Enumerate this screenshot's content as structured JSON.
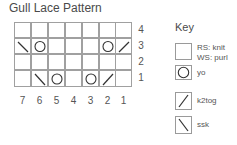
{
  "title": "Gull Lace Pattern",
  "chart": {
    "columns": 7,
    "rows": 4,
    "row_labels": [
      "4",
      "3",
      "2",
      "1"
    ],
    "column_labels": [
      "7",
      "6",
      "5",
      "4",
      "3",
      "2",
      "1"
    ],
    "cells": [
      [
        "",
        "",
        "",
        "",
        "",
        "",
        ""
      ],
      [
        "ssk",
        "yo",
        "",
        "",
        "",
        "yo",
        "k2tog"
      ],
      [
        "",
        "",
        "",
        "",
        "",
        "",
        ""
      ],
      [
        "",
        "ssk",
        "yo",
        "",
        "yo",
        "k2tog",
        ""
      ]
    ]
  },
  "key": {
    "title": "Key",
    "items": [
      {
        "symbol": "blank",
        "label_line1": "RS: knit",
        "label_line2": "WS: purl"
      },
      {
        "symbol": "yo",
        "label_line1": "yo",
        "label_line2": ""
      },
      {
        "symbol": "k2tog",
        "label_line1": "k2tog",
        "label_line2": ""
      },
      {
        "symbol": "ssk",
        "label_line1": "ssk",
        "label_line2": ""
      }
    ]
  },
  "colors": {
    "grid_line": "#a0a0a0",
    "symbol": "#333333",
    "text": "#555555"
  }
}
